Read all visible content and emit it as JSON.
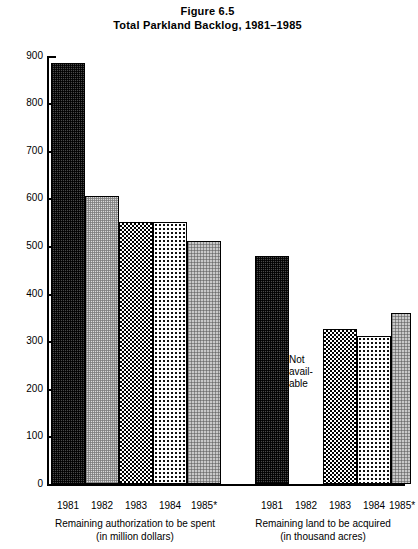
{
  "figure": {
    "title_line1": "Figure 6.5",
    "title_line2": "Total Parkland Backlog, 1981–1985"
  },
  "annotations": {
    "not_available_line1": "Not",
    "not_available_line2": "avail-",
    "not_available_line3": "able"
  },
  "axis": {
    "ticks": [
      "900",
      "800",
      "700",
      "600",
      "500",
      "400",
      "300",
      "200",
      "100",
      "0"
    ]
  },
  "groups": [
    {
      "caption_line1": "Remaining authorization to be spent",
      "caption_line2": "(in million dollars)",
      "labels": [
        "1981",
        "1982",
        "1983",
        "1984",
        "1985*"
      ]
    },
    {
      "caption_line1": "Remaining land to be acquired",
      "caption_line2": "(in thousand acres)",
      "labels": [
        "1981",
        "1982",
        "1983",
        "1984",
        "1985*"
      ]
    }
  ],
  "chart_data": {
    "type": "bar",
    "xlabel": "",
    "ylabel": "",
    "ylim": [
      0,
      900
    ],
    "ytick_step": 100,
    "grid": false,
    "legend": "none",
    "categories": [
      "1981",
      "1982",
      "1983",
      "1984",
      "1985*"
    ],
    "series": [
      {
        "name": "Remaining authorization to be spent (in million dollars)",
        "values": [
          885,
          605,
          552,
          550,
          512
        ],
        "units": "million dollars"
      },
      {
        "name": "Remaining land to be acquired (in thousand acres)",
        "values": [
          480,
          null,
          325,
          312,
          360
        ],
        "units": "thousand acres",
        "missing_note": "Not available"
      }
    ],
    "footnote_marker": "*"
  }
}
